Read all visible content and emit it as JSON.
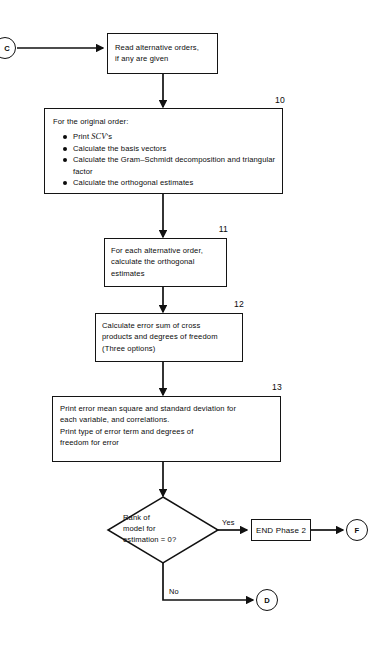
{
  "diagram": {
    "line_color": "#111111",
    "background": "#ffffff"
  },
  "connectors": {
    "entry": {
      "label": "C"
    },
    "exit_yes": {
      "label": "F"
    },
    "exit_no": {
      "label": "D"
    }
  },
  "nodes": {
    "read_orders": {
      "text": "Read alternative orders,\nif any are given"
    },
    "step10": {
      "number": "10",
      "heading": "For the original order:",
      "bullets": [
        {
          "pre": "Print ",
          "emph": "SCV",
          "post": "’s"
        },
        {
          "pre": "Calculate the basis vectors",
          "emph": "",
          "post": ""
        },
        {
          "pre": "Calculate the Gram–Schmidt decomposition and triangular factor",
          "emph": "",
          "post": ""
        },
        {
          "pre": "Calculate the orthogonal estimates",
          "emph": "",
          "post": ""
        }
      ]
    },
    "step11": {
      "number": "11",
      "text": "For each alternative order,\ncalculate the orthogonal\nestimates"
    },
    "step12": {
      "number": "12",
      "text": "Calculate error sum of cross\nproducts and degrees of freedom\n(Three options)"
    },
    "step13": {
      "number": "13",
      "text": "Print error mean square and standard deviation for\neach variable, and correlations.\nPrint type of error term and degrees of\nfreedom for error"
    },
    "decision": {
      "text": "Rank of\nmodel for\nestimation = 0?"
    },
    "end_phase": {
      "label": "END Phase 2"
    }
  },
  "edges": {
    "yes_label": "Yes",
    "no_label": "No"
  }
}
